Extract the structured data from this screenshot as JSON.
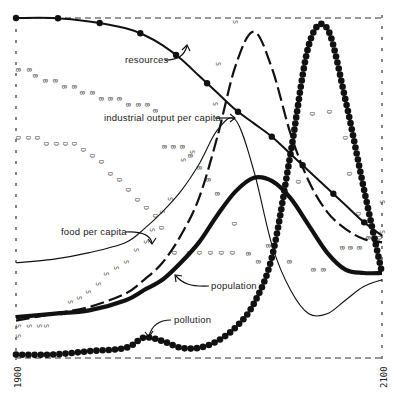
{
  "chart_data": {
    "type": "line",
    "title": "",
    "xlabel": "",
    "ylabel": "",
    "xlim": [
      1900,
      2100
    ],
    "ylim": [
      0,
      1
    ],
    "grid": false,
    "legend": "inline annotations with arrows",
    "x_tick_labels": [
      "1900",
      "2100"
    ],
    "x": [
      1900,
      1920,
      1940,
      1960,
      1970,
      1980,
      1990,
      2000,
      2010,
      2020,
      2030,
      2040,
      2050,
      2060,
      2070,
      2080,
      2090,
      2100
    ],
    "series": [
      {
        "name": "resources",
        "style": "solid line with round dot markers",
        "values": [
          1.0,
          1.0,
          0.99,
          0.97,
          0.95,
          0.92,
          0.88,
          0.83,
          0.78,
          0.73,
          0.69,
          0.65,
          0.6,
          0.55,
          0.5,
          0.45,
          0.4,
          0.36
        ]
      },
      {
        "name": "industrial output per capita",
        "style": "long dashed line",
        "values": [
          0.11,
          0.13,
          0.15,
          0.19,
          0.23,
          0.28,
          0.36,
          0.47,
          0.65,
          0.86,
          0.96,
          0.85,
          0.66,
          0.52,
          0.43,
          0.38,
          0.35,
          0.34
        ]
      },
      {
        "name": "food per capita",
        "style": "thin solid line",
        "values": [
          0.28,
          0.29,
          0.31,
          0.34,
          0.38,
          0.43,
          0.49,
          0.57,
          0.67,
          0.7,
          0.55,
          0.33,
          0.2,
          0.13,
          0.13,
          0.17,
          0.21,
          0.23
        ]
      },
      {
        "name": "population",
        "style": "thick solid line",
        "values": [
          0.12,
          0.13,
          0.14,
          0.17,
          0.2,
          0.23,
          0.28,
          0.34,
          0.42,
          0.49,
          0.53,
          0.52,
          0.47,
          0.39,
          0.31,
          0.26,
          0.25,
          0.25
        ]
      },
      {
        "name": "pollution",
        "style": "large round dots",
        "values": [
          0.01,
          0.01,
          0.02,
          0.03,
          0.06,
          0.05,
          0.03,
          0.03,
          0.05,
          0.09,
          0.16,
          0.3,
          0.6,
          0.92,
          0.97,
          0.76,
          0.5,
          0.25
        ]
      }
    ],
    "annotations": [
      {
        "text": "resources",
        "points_to": "resources"
      },
      {
        "text": "industrial output per capita",
        "points_to": "industrial output per capita"
      },
      {
        "text": "food per capita",
        "points_to": "food per capita"
      },
      {
        "text": "population",
        "points_to": "population"
      },
      {
        "text": "pollution",
        "points_to": "pollution"
      }
    ],
    "letter_markers": [
      "B",
      "D",
      "S",
      "F",
      "I"
    ]
  },
  "labels": {
    "resources": "resources",
    "industrial": "industrial output per capita",
    "food": "food per capita",
    "population": "population",
    "pollution": "pollution",
    "x_start": "1900",
    "x_end": "2100"
  }
}
